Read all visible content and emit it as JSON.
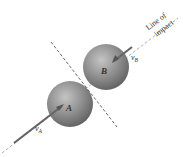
{
  "diagram": {
    "spheres": [
      {
        "id": "A",
        "label": "A"
      },
      {
        "id": "B",
        "label": "B"
      }
    ],
    "velocities": [
      {
        "id": "vA",
        "symbol": "v",
        "subscript": "A"
      },
      {
        "id": "vB",
        "symbol": "v",
        "subscript": "B"
      }
    ],
    "line_of_impact_label": [
      "Line of",
      "impact"
    ],
    "colors": {
      "sphere": "#8a8a8a",
      "line": "#777777",
      "arrow": "#555555"
    }
  }
}
